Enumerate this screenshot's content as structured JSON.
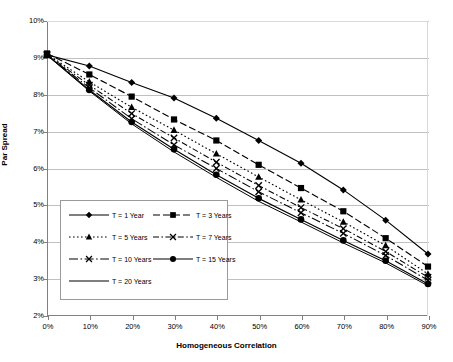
{
  "chart_data": {
    "type": "line",
    "title": "",
    "xlabel": "Homogeneous Correlation",
    "ylabel": "Par Spread",
    "xlim": [
      0,
      90
    ],
    "ylim": [
      2,
      10
    ],
    "x": [
      0,
      10,
      20,
      30,
      40,
      50,
      60,
      70,
      80,
      90
    ],
    "xticklabels": [
      "0%",
      "10%",
      "20%",
      "30%",
      "40%",
      "50%",
      "60%",
      "70%",
      "80%",
      "90%"
    ],
    "yticklabels": [
      "2%",
      "3%",
      "4%",
      "5%",
      "6%",
      "7%",
      "8%",
      "9%",
      "10%"
    ],
    "yticks": [
      2,
      3,
      4,
      5,
      6,
      7,
      8,
      9,
      10
    ],
    "grid": "horizontal",
    "legend_position": "lower-left-inside",
    "series": [
      {
        "name": "T = 1 Year",
        "marker": "diamond",
        "dash": "solid",
        "values": [
          9.08,
          8.78,
          8.33,
          7.91,
          7.36,
          6.76,
          6.14,
          5.42,
          4.6,
          3.68
        ]
      },
      {
        "name": "T = 3 Years",
        "marker": "square",
        "dash": "long-dash",
        "values": [
          9.12,
          8.55,
          7.95,
          7.33,
          6.76,
          6.1,
          5.47,
          4.84,
          4.11,
          3.34
        ]
      },
      {
        "name": "T = 5 Years",
        "marker": "triangle",
        "dash": "dotted",
        "values": [
          9.1,
          8.35,
          7.66,
          7.04,
          6.4,
          5.77,
          5.15,
          4.55,
          3.91,
          3.14
        ]
      },
      {
        "name": "T = 7 Years",
        "marker": "cross",
        "dash": "dash-dot",
        "values": [
          9.09,
          8.26,
          7.49,
          6.83,
          6.17,
          5.54,
          4.94,
          4.37,
          3.75,
          3.05
        ]
      },
      {
        "name": "T = 10 Years",
        "marker": "cross",
        "dash": "dash-dot-long",
        "values": [
          9.08,
          8.19,
          7.35,
          6.64,
          6.0,
          5.37,
          4.8,
          4.24,
          3.64,
          2.97
        ]
      },
      {
        "name": "T = 15 Years",
        "marker": "circle",
        "dash": "solid",
        "values": [
          9.08,
          8.13,
          7.26,
          6.52,
          5.83,
          5.19,
          4.62,
          4.05,
          3.5,
          2.87
        ]
      },
      {
        "name": "T = 20 Years",
        "marker": "none",
        "dash": "solid-thin",
        "values": [
          9.07,
          8.1,
          7.21,
          6.45,
          5.76,
          5.11,
          4.55,
          3.98,
          3.44,
          2.82
        ]
      }
    ]
  },
  "axes": {
    "x_title": "Homogeneous Correlation",
    "y_title": "Par Spread",
    "x_labels": [
      "0%",
      "10%",
      "20%",
      "30%",
      "40%",
      "50%",
      "60%",
      "70%",
      "80%",
      "90%"
    ],
    "y_labels": [
      "10%",
      "9%",
      "8%",
      "7%",
      "6%",
      "5%",
      "4%",
      "3%",
      "2%"
    ]
  },
  "legend": {
    "entries": [
      {
        "label": "T = 1 Year"
      },
      {
        "label": "T = 3 Years"
      },
      {
        "label": "T = 5 Years"
      },
      {
        "label": "T = 7 Years"
      },
      {
        "label": "T = 10 Years"
      },
      {
        "label": "T = 15 Years"
      },
      {
        "label": "T = 20 Years"
      }
    ]
  },
  "colors": {
    "ink": "#000000",
    "grid": "#c0c0c0",
    "axis": "#808080",
    "background": "#ffffff"
  }
}
